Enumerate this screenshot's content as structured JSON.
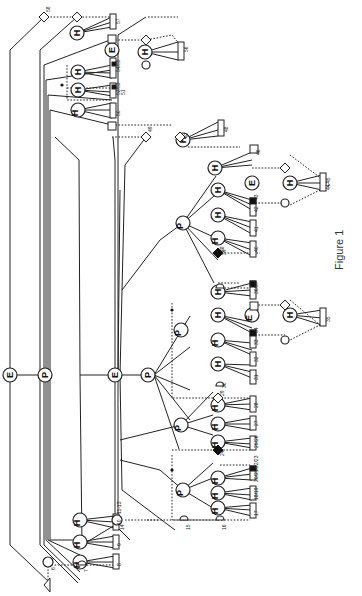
{
  "figure": {
    "caption": "Figure 1",
    "orientation": "rotated 90deg counter-clockwise",
    "node_types": {
      "E": "E",
      "P": "P",
      "H": "H"
    }
  },
  "labels": {
    "n58": "58",
    "n57": "57",
    "n56": "56",
    "n5455": "54/55",
    "n5253": "52/53",
    "n51": "51",
    "n50": "50",
    "n49": "49",
    "n48": "48",
    "n47": "47",
    "n46": "46",
    "n4445": "44 45",
    "n43": "43",
    "n42": "42",
    "n41": "41",
    "n40": "40",
    "n39": "39",
    "n38": "38",
    "n3637": "36/37",
    "n35": "35",
    "n34": "34",
    "n33": "33",
    "n32": "32",
    "n31": "31",
    "n30": "30",
    "n29": "29",
    "n28": "28",
    "n27": "27",
    "n2526": "25/26",
    "n24": "24",
    "n2023": "20/21/22/23",
    "n1819": "18/19",
    "n17": "17",
    "n16": "16",
    "n15": "15",
    "n14": "14",
    "n10": "10",
    "n1113": "11-13",
    "n9": "9",
    "n8": "8",
    "n7": "7",
    "n6": "6"
  }
}
